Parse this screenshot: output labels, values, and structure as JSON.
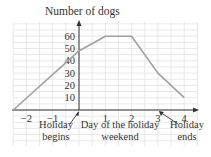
{
  "chart_data": {
    "type": "line",
    "title": "",
    "ylabel": "Number of dogs",
    "xlabel": "Day of the holiday weekend",
    "x": [
      -2.5,
      0,
      1,
      2,
      3,
      4
    ],
    "series": [
      {
        "name": "Number of dogs",
        "values": [
          0,
          48,
          60,
          60,
          30,
          10
        ]
      }
    ],
    "x_ticks": [
      "−2",
      "−1",
      "1",
      "2",
      "3",
      "4"
    ],
    "y_ticks": [
      "10",
      "20",
      "30",
      "40",
      "50",
      "60"
    ],
    "xlim": [
      -2.5,
      4.5
    ],
    "ylim": [
      0,
      70
    ],
    "grid": true,
    "annotations": [
      {
        "text": "Holiday begins",
        "points_to_x": 0
      },
      {
        "text": "Holiday ends",
        "points_to_x": 3
      }
    ],
    "colors": {
      "line": "#a0a0a0",
      "axis": "#333333",
      "grid": "#e2e2e2"
    }
  },
  "labels": {
    "y_axis_title": "Number of dogs",
    "x_axis_title_line1": "Day of the holiday",
    "x_axis_title_line2": "weekend",
    "begin_line1": "Holiday",
    "begin_line2": "begins",
    "end_line1": "Holiday",
    "end_line2": "ends"
  }
}
